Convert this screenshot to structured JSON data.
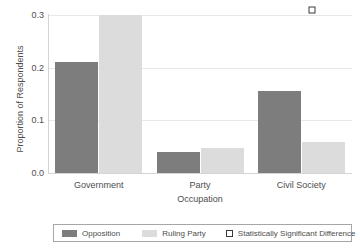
{
  "chart_data": {
    "type": "bar",
    "title": "",
    "subtitle": "",
    "xlabel": "Occupation",
    "ylabel": "Proportion of Respondents",
    "categories": [
      "Government",
      "Party",
      "Civil Society"
    ],
    "series": [
      {
        "name": "Opposition",
        "color": "#7d7d7d",
        "values": [
          0.21,
          0.04,
          0.155
        ]
      },
      {
        "name": "Ruling Party",
        "color": "#dcdcdc",
        "values": [
          0.3,
          0.048,
          0.058
        ]
      }
    ],
    "annotations": [
      {
        "name": "Statistically Significant Difference",
        "marker": "open-square",
        "color": "#3b3b3b",
        "category": "Civil Society",
        "y": 0.31
      }
    ],
    "ylim": [
      0.0,
      0.31
    ],
    "yticks": [
      "0.0",
      "0.1",
      "0.2",
      "0.3"
    ],
    "ytick_values": [
      0.0,
      0.1,
      0.2,
      0.3
    ],
    "grid": "horizontal-light",
    "legend_position": "bottom",
    "legend_entries": [
      {
        "label": "Opposition",
        "swatch": "opposition"
      },
      {
        "label": "Ruling Party",
        "swatch": "ruling"
      },
      {
        "label": "Statistically Significant Difference",
        "swatch": "sig"
      }
    ]
  }
}
